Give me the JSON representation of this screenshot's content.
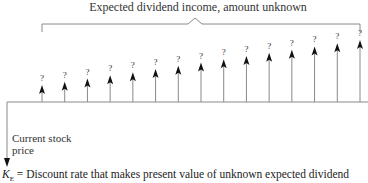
{
  "diagram": {
    "title": "Expected dividend income, amount unknown",
    "arrow_count": 15,
    "arrow_label": "?",
    "current_price_label_line1": "Current stock",
    "current_price_label_line2": "price",
    "caption_symbol": "K",
    "caption_subscript": "E",
    "caption_text": " = Discount rate that makes present value of unknown expected dividend"
  },
  "colors": {
    "line": "#8a8a8a",
    "arrowhead": "#111111",
    "text": "#333333"
  }
}
